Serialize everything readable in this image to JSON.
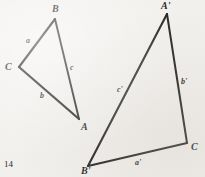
{
  "figure": {
    "page_number": "14",
    "background_color": "#f2f0ed",
    "ink_color": "#1a1a1a",
    "triangles": [
      {
        "name": "triangle-abc",
        "vertices": [
          {
            "key": "B",
            "label": "B",
            "x": 55,
            "y": 19,
            "label_x": 52,
            "label_y": 4
          },
          {
            "key": "C",
            "label": "C",
            "x": 19,
            "y": 67,
            "label_x": 5,
            "label_y": 62
          },
          {
            "key": "A",
            "label": "A",
            "x": 79,
            "y": 119,
            "label_x": 81,
            "label_y": 122
          }
        ],
        "sides": [
          {
            "key": "a",
            "label": "a",
            "from": "C",
            "to": "B",
            "label_x": 26,
            "label_y": 37
          },
          {
            "key": "b",
            "label": "b",
            "from": "C",
            "to": "A",
            "label_x": 40,
            "label_y": 92
          },
          {
            "key": "c",
            "label": "c",
            "from": "B",
            "to": "A",
            "label_x": 70,
            "label_y": 64
          }
        ]
      },
      {
        "name": "triangle-a-prime-b-prime-c-prime",
        "vertices": [
          {
            "key": "A'",
            "label": "A'",
            "x": 167,
            "y": 14,
            "label_x": 161,
            "label_y": 1
          },
          {
            "key": "B'",
            "label": "B'",
            "x": 88,
            "y": 166,
            "label_x": 81,
            "label_y": 166
          },
          {
            "key": "C'",
            "label": "C",
            "x": 187,
            "y": 143,
            "label_x": 191,
            "label_y": 142
          }
        ],
        "sides": [
          {
            "key": "a'",
            "label": "a'",
            "from": "B'",
            "to": "C'",
            "label_x": 135,
            "label_y": 159
          },
          {
            "key": "b'",
            "label": "b'",
            "from": "A'",
            "to": "C'",
            "label_x": 181,
            "label_y": 78
          },
          {
            "key": "c'",
            "label": "c'",
            "from": "A'",
            "to": "B'",
            "label_x": 117,
            "label_y": 86
          }
        ]
      }
    ]
  }
}
